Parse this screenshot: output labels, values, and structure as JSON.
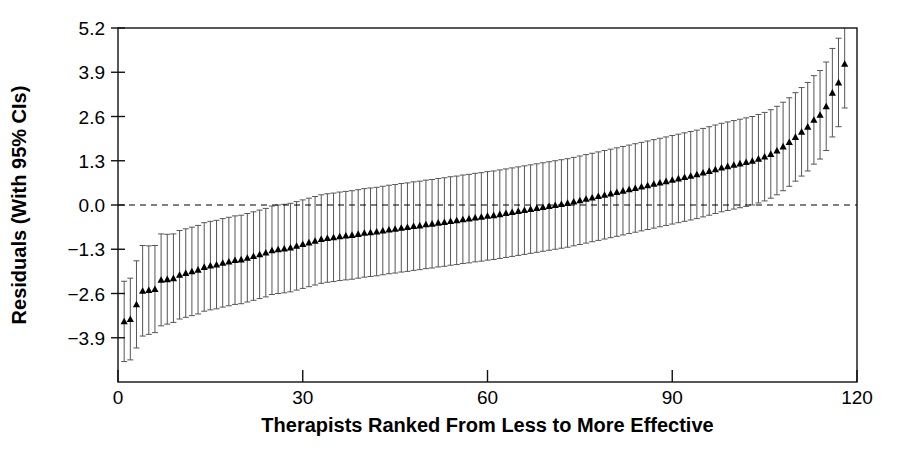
{
  "chart_data": {
    "type": "scatter",
    "title": "",
    "xlabel": "Therapists Ranked From Less to More Effective",
    "ylabel": "Residuals (With 95% CIs)",
    "xlim": [
      0,
      120
    ],
    "ylim": [
      -5.2,
      5.2
    ],
    "xticks": [
      0,
      30,
      60,
      90,
      120
    ],
    "xticklabels": [
      "0",
      "30",
      "60",
      "90",
      "120"
    ],
    "yticks": [
      -3.9,
      -2.6,
      -1.3,
      0.0,
      1.3,
      2.6,
      3.9,
      5.2
    ],
    "yticklabels": [
      "−3.9",
      "−2.6",
      "−1.3",
      "0.0",
      "1.3",
      "2.6",
      "3.9",
      "5.2"
    ],
    "grid": false,
    "legend": null,
    "reference_line": {
      "y": 0.0,
      "style": "dashed",
      "color": "#000000"
    },
    "marker": "triangle-up",
    "marker_color": "#000000",
    "errorbar_color": "#555555",
    "errorbar_label": "95% CI",
    "series": [
      {
        "name": "Therapist residual",
        "x": [
          1,
          2,
          3,
          4,
          5,
          6,
          7,
          8,
          9,
          10,
          11,
          12,
          13,
          14,
          15,
          16,
          17,
          18,
          19,
          20,
          21,
          22,
          23,
          24,
          25,
          26,
          27,
          28,
          29,
          30,
          31,
          32,
          33,
          34,
          35,
          36,
          37,
          38,
          39,
          40,
          41,
          42,
          43,
          44,
          45,
          46,
          47,
          48,
          49,
          50,
          51,
          52,
          53,
          54,
          55,
          56,
          57,
          58,
          59,
          60,
          61,
          62,
          63,
          64,
          65,
          66,
          67,
          68,
          69,
          70,
          71,
          72,
          73,
          74,
          75,
          76,
          77,
          78,
          79,
          80,
          81,
          82,
          83,
          84,
          85,
          86,
          87,
          88,
          89,
          90,
          91,
          92,
          93,
          94,
          95,
          96,
          97,
          98,
          99,
          100,
          101,
          102,
          103,
          104,
          105,
          106,
          107,
          108,
          109,
          110,
          111,
          112,
          113,
          114,
          115,
          116,
          117,
          118
        ],
        "y": [
          -3.42,
          -3.35,
          -2.92,
          -2.52,
          -2.5,
          -2.47,
          -2.2,
          -2.18,
          -2.15,
          -2.05,
          -2.0,
          -1.95,
          -1.9,
          -1.82,
          -1.78,
          -1.75,
          -1.7,
          -1.66,
          -1.62,
          -1.6,
          -1.55,
          -1.5,
          -1.45,
          -1.4,
          -1.33,
          -1.3,
          -1.28,
          -1.25,
          -1.2,
          -1.15,
          -1.1,
          -1.05,
          -1.0,
          -0.97,
          -0.95,
          -0.92,
          -0.9,
          -0.88,
          -0.85,
          -0.82,
          -0.8,
          -0.78,
          -0.75,
          -0.72,
          -0.7,
          -0.67,
          -0.65,
          -0.62,
          -0.6,
          -0.57,
          -0.55,
          -0.52,
          -0.5,
          -0.47,
          -0.45,
          -0.42,
          -0.4,
          -0.37,
          -0.35,
          -0.32,
          -0.3,
          -0.27,
          -0.24,
          -0.21,
          -0.18,
          -0.15,
          -0.12,
          -0.09,
          -0.06,
          -0.03,
          0.0,
          0.03,
          0.06,
          0.1,
          0.14,
          0.18,
          0.22,
          0.26,
          0.3,
          0.34,
          0.38,
          0.42,
          0.46,
          0.5,
          0.54,
          0.58,
          0.62,
          0.66,
          0.7,
          0.74,
          0.78,
          0.82,
          0.86,
          0.9,
          0.95,
          1.0,
          1.05,
          1.1,
          1.14,
          1.18,
          1.22,
          1.26,
          1.3,
          1.36,
          1.42,
          1.5,
          1.6,
          1.72,
          1.85,
          2.0,
          2.15,
          2.3,
          2.5,
          2.65,
          2.9,
          3.3,
          3.6,
          4.15
        ],
        "ci_low": [
          -4.6,
          -4.55,
          -4.2,
          -3.85,
          -3.8,
          -3.75,
          -3.55,
          -3.5,
          -3.45,
          -3.35,
          -3.3,
          -3.25,
          -3.2,
          -3.12,
          -3.08,
          -3.05,
          -3.0,
          -2.96,
          -2.92,
          -2.9,
          -2.85,
          -2.8,
          -2.75,
          -2.7,
          -2.63,
          -2.6,
          -2.58,
          -2.55,
          -2.5,
          -2.45,
          -2.4,
          -2.35,
          -2.3,
          -2.27,
          -2.25,
          -2.22,
          -2.2,
          -2.18,
          -2.15,
          -2.12,
          -2.1,
          -2.08,
          -2.05,
          -2.02,
          -2.0,
          -1.97,
          -1.95,
          -1.92,
          -1.9,
          -1.87,
          -1.85,
          -1.82,
          -1.8,
          -1.77,
          -1.75,
          -1.72,
          -1.7,
          -1.67,
          -1.65,
          -1.62,
          -1.6,
          -1.57,
          -1.54,
          -1.51,
          -1.48,
          -1.45,
          -1.42,
          -1.39,
          -1.36,
          -1.33,
          -1.3,
          -1.27,
          -1.24,
          -1.2,
          -1.16,
          -1.12,
          -1.08,
          -1.04,
          -1.0,
          -0.96,
          -0.92,
          -0.88,
          -0.84,
          -0.8,
          -0.76,
          -0.72,
          -0.68,
          -0.64,
          -0.6,
          -0.56,
          -0.52,
          -0.48,
          -0.44,
          -0.4,
          -0.35,
          -0.3,
          -0.25,
          -0.2,
          -0.16,
          -0.12,
          -0.08,
          -0.04,
          0.0,
          0.06,
          0.12,
          0.2,
          0.3,
          0.42,
          0.55,
          0.7,
          0.85,
          1.0,
          1.2,
          1.35,
          1.6,
          2.0,
          2.3,
          2.85
        ],
        "ci_high": [
          -2.24,
          -2.15,
          -1.64,
          -1.19,
          -1.2,
          -1.19,
          -0.85,
          -0.86,
          -0.85,
          -0.75,
          -0.7,
          -0.65,
          -0.6,
          -0.52,
          -0.48,
          -0.45,
          -0.4,
          -0.36,
          -0.32,
          -0.3,
          -0.25,
          -0.2,
          -0.15,
          -0.1,
          -0.03,
          0.0,
          0.02,
          0.05,
          0.1,
          0.15,
          0.2,
          0.25,
          0.3,
          0.33,
          0.35,
          0.38,
          0.4,
          0.42,
          0.45,
          0.48,
          0.5,
          0.52,
          0.55,
          0.58,
          0.6,
          0.63,
          0.65,
          0.68,
          0.7,
          0.73,
          0.75,
          0.78,
          0.8,
          0.83,
          0.85,
          0.88,
          0.9,
          0.93,
          0.95,
          0.98,
          1.0,
          1.03,
          1.06,
          1.09,
          1.12,
          1.15,
          1.18,
          1.21,
          1.24,
          1.27,
          1.3,
          1.33,
          1.36,
          1.4,
          1.44,
          1.48,
          1.52,
          1.56,
          1.6,
          1.64,
          1.68,
          1.72,
          1.76,
          1.8,
          1.84,
          1.88,
          1.92,
          1.96,
          2.0,
          2.04,
          2.08,
          2.12,
          2.16,
          2.2,
          2.25,
          2.3,
          2.35,
          2.4,
          2.44,
          2.48,
          2.52,
          2.56,
          2.6,
          2.66,
          2.72,
          2.8,
          2.9,
          3.02,
          3.15,
          3.3,
          3.45,
          3.6,
          3.8,
          3.95,
          4.2,
          4.6,
          4.9,
          5.45
        ]
      }
    ]
  }
}
